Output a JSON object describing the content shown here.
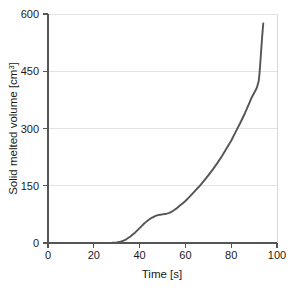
{
  "chart_data": {
    "type": "line",
    "title": "",
    "xlabel": "Time [s]",
    "ylabel": "Solid melted volume [cm3]",
    "ylabel_base": "Solid melted volume [cm",
    "ylabel_sup": "3",
    "ylabel_tail": "]",
    "xlim": [
      0,
      100
    ],
    "ylim": [
      0,
      600
    ],
    "xticks": [
      0,
      20,
      40,
      60,
      80,
      100
    ],
    "yticks": [
      0,
      150,
      300,
      450,
      600
    ],
    "xtick_labels": [
      "0",
      "20",
      "40",
      "60",
      "80",
      "100"
    ],
    "ytick_labels": [
      "0",
      "150",
      "300",
      "450",
      "600"
    ],
    "grid": "horizontal",
    "legend": "none",
    "line_color": "#555555",
    "grid_color": "#e3e3e3",
    "background_color": "#ffffff",
    "series": [
      {
        "name": "Solid melted volume",
        "x": [
          0,
          5,
          10,
          15,
          20,
          25,
          28,
          30,
          31,
          32,
          33,
          34,
          35,
          36,
          37,
          38,
          39,
          40,
          41,
          42,
          43,
          44,
          45,
          46,
          47,
          48,
          49,
          50,
          51,
          52,
          53,
          54,
          55,
          56,
          57,
          58,
          59,
          60,
          62,
          64,
          66,
          68,
          70,
          72,
          74,
          76,
          78,
          80,
          82,
          84,
          86,
          88,
          89,
          90,
          91,
          91.5,
          92,
          92.3,
          92.6,
          92.9,
          93.2,
          93.5,
          93.8,
          94
        ],
        "y": [
          0,
          0,
          0,
          0,
          0,
          0,
          0.5,
          1.5,
          2.5,
          4,
          6,
          9,
          13,
          17,
          22,
          27,
          33,
          39,
          45,
          51,
          56,
          61,
          65,
          68,
          71,
          73,
          74,
          75,
          76,
          77,
          79,
          82,
          86,
          90,
          95,
          100,
          105,
          110,
          122,
          135,
          148,
          162,
          177,
          193,
          210,
          228,
          248,
          268,
          292,
          315,
          340,
          368,
          382,
          393,
          404,
          413,
          424,
          440,
          462,
          488,
          514,
          539,
          561,
          575
        ]
      }
    ]
  }
}
